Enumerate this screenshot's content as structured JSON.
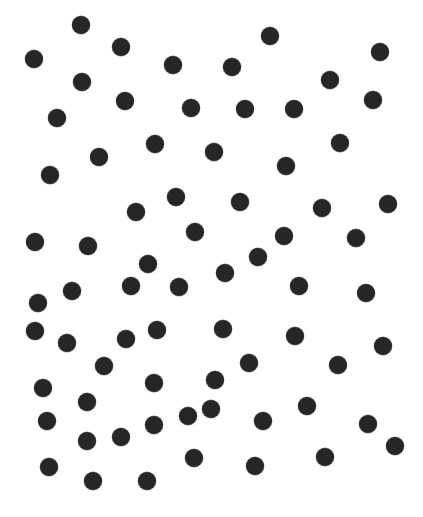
{
  "image": {
    "width": 423,
    "height": 517,
    "background": "#ffffff",
    "dot_color": "#262626",
    "dot_diameter": 18
  },
  "dots": [
    {
      "x": 81,
      "y": 25
    },
    {
      "x": 270,
      "y": 36
    },
    {
      "x": 121,
      "y": 47
    },
    {
      "x": 380,
      "y": 52
    },
    {
      "x": 34,
      "y": 59
    },
    {
      "x": 173,
      "y": 65
    },
    {
      "x": 232,
      "y": 67
    },
    {
      "x": 330,
      "y": 80
    },
    {
      "x": 82,
      "y": 82
    },
    {
      "x": 373,
      "y": 100
    },
    {
      "x": 125,
      "y": 101
    },
    {
      "x": 191,
      "y": 108
    },
    {
      "x": 245,
      "y": 109
    },
    {
      "x": 294,
      "y": 109
    },
    {
      "x": 57,
      "y": 118
    },
    {
      "x": 340,
      "y": 143
    },
    {
      "x": 155,
      "y": 144
    },
    {
      "x": 214,
      "y": 152
    },
    {
      "x": 99,
      "y": 157
    },
    {
      "x": 286,
      "y": 166
    },
    {
      "x": 50,
      "y": 175
    },
    {
      "x": 176,
      "y": 197
    },
    {
      "x": 240,
      "y": 202
    },
    {
      "x": 388,
      "y": 204
    },
    {
      "x": 322,
      "y": 208
    },
    {
      "x": 136,
      "y": 212
    },
    {
      "x": 195,
      "y": 232
    },
    {
      "x": 284,
      "y": 236
    },
    {
      "x": 356,
      "y": 238
    },
    {
      "x": 35,
      "y": 242
    },
    {
      "x": 88,
      "y": 246
    },
    {
      "x": 258,
      "y": 257
    },
    {
      "x": 148,
      "y": 264
    },
    {
      "x": 225,
      "y": 273
    },
    {
      "x": 131,
      "y": 286
    },
    {
      "x": 179,
      "y": 287
    },
    {
      "x": 299,
      "y": 286
    },
    {
      "x": 72,
      "y": 291
    },
    {
      "x": 366,
      "y": 293
    },
    {
      "x": 38,
      "y": 303
    },
    {
      "x": 223,
      "y": 329
    },
    {
      "x": 157,
      "y": 330
    },
    {
      "x": 35,
      "y": 331
    },
    {
      "x": 295,
      "y": 336
    },
    {
      "x": 126,
      "y": 339
    },
    {
      "x": 67,
      "y": 343
    },
    {
      "x": 383,
      "y": 346
    },
    {
      "x": 249,
      "y": 363
    },
    {
      "x": 338,
      "y": 365
    },
    {
      "x": 104,
      "y": 366
    },
    {
      "x": 215,
      "y": 380
    },
    {
      "x": 154,
      "y": 383
    },
    {
      "x": 43,
      "y": 388
    },
    {
      "x": 87,
      "y": 402
    },
    {
      "x": 307,
      "y": 406
    },
    {
      "x": 211,
      "y": 409
    },
    {
      "x": 188,
      "y": 416
    },
    {
      "x": 47,
      "y": 421
    },
    {
      "x": 263,
      "y": 421
    },
    {
      "x": 368,
      "y": 424
    },
    {
      "x": 154,
      "y": 425
    },
    {
      "x": 121,
      "y": 437
    },
    {
      "x": 87,
      "y": 441
    },
    {
      "x": 395,
      "y": 446
    },
    {
      "x": 325,
      "y": 457
    },
    {
      "x": 194,
      "y": 458
    },
    {
      "x": 255,
      "y": 466
    },
    {
      "x": 49,
      "y": 467
    },
    {
      "x": 93,
      "y": 481
    },
    {
      "x": 147,
      "y": 481
    }
  ]
}
